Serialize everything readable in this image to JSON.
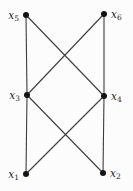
{
  "diagram": {
    "type": "graph",
    "width": 133,
    "height": 191,
    "background_color": "#fcfcfc",
    "edge_color": "#3d3d3d",
    "edge_width": 1.1,
    "node_color": "#141414",
    "node_radius": 3,
    "label_color": "#1d1d1d",
    "nodes": [
      {
        "id": "x5",
        "label_base": "x",
        "label_sub": "5",
        "x": 26,
        "y": 15,
        "label_side": "left"
      },
      {
        "id": "x6",
        "label_base": "x",
        "label_sub": "6",
        "x": 104,
        "y": 14,
        "label_side": "right"
      },
      {
        "id": "x3",
        "label_base": "x",
        "label_sub": "3",
        "x": 27,
        "y": 95,
        "label_side": "left"
      },
      {
        "id": "x4",
        "label_base": "x",
        "label_sub": "4",
        "x": 104,
        "y": 96,
        "label_side": "right"
      },
      {
        "id": "x1",
        "label_base": "x",
        "label_sub": "1",
        "x": 26,
        "y": 174,
        "label_side": "left"
      },
      {
        "id": "x2",
        "label_base": "x",
        "label_sub": "2",
        "x": 103,
        "y": 173,
        "label_side": "right"
      }
    ],
    "edges": [
      {
        "from": "x5",
        "to": "x3"
      },
      {
        "from": "x5",
        "to": "x4"
      },
      {
        "from": "x6",
        "to": "x3"
      },
      {
        "from": "x6",
        "to": "x4"
      },
      {
        "from": "x3",
        "to": "x1"
      },
      {
        "from": "x3",
        "to": "x2"
      },
      {
        "from": "x4",
        "to": "x1"
      },
      {
        "from": "x4",
        "to": "x2"
      }
    ]
  }
}
